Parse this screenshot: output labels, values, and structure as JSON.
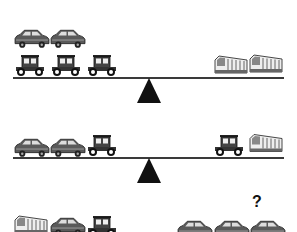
{
  "puzzle": {
    "type": "balance-scale-puzzle",
    "colors": {
      "beam": "#3a3a3a",
      "fulcrum": "#111111",
      "vehicle": "#555555"
    },
    "scales": [
      {
        "id": 1,
        "left": [
          "modern-car",
          "modern-car",
          "vintage-car",
          "vintage-car",
          "vintage-car"
        ],
        "right": [
          "bus",
          "bus"
        ]
      },
      {
        "id": 2,
        "left": [
          "modern-car",
          "modern-car",
          "vintage-car"
        ],
        "right": [
          "vintage-car",
          "bus"
        ]
      },
      {
        "id": 3,
        "left": [
          "bus",
          "modern-car",
          "vintage-car"
        ],
        "right": [
          "modern-car",
          "modern-car",
          "modern-car"
        ],
        "unknown_marker": "?"
      }
    ]
  }
}
